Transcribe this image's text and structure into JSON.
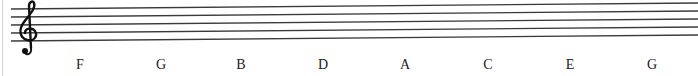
{
  "staff": {
    "clef": "treble-clef",
    "line_count": 5,
    "line_color": "#3a3a3a",
    "note_names": [
      "F",
      "G",
      "B",
      "D",
      "A",
      "C",
      "E",
      "G"
    ]
  },
  "labels": [
    {
      "text": "F",
      "x": 80
    },
    {
      "text": "G",
      "x": 161
    },
    {
      "text": "B",
      "x": 241
    },
    {
      "text": "D",
      "x": 323
    },
    {
      "text": "A",
      "x": 405
    },
    {
      "text": "C",
      "x": 488
    },
    {
      "text": "E",
      "x": 570
    },
    {
      "text": "G",
      "x": 652
    }
  ]
}
